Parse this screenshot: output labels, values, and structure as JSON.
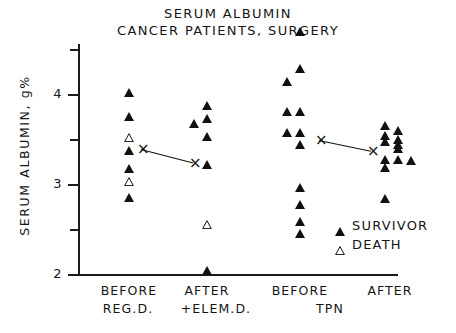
{
  "title": {
    "line1": "SERUM ALBUMIN",
    "line2": "CANCER PATIENTS, SURGERY"
  },
  "axes": {
    "y_title": "SERUM ALBUMIN, g%",
    "y_ticks_major": [
      "4",
      "3",
      "2"
    ],
    "y_ticks_minor": [
      "4.5",
      "3.5",
      "2.5"
    ],
    "ylim": [
      2,
      4.7
    ],
    "x_group_labels": [
      "BEFORE",
      "AFTER",
      "BEFORE",
      "AFTER"
    ],
    "x_treatment_labels": [
      "REG.D.",
      "+ELEM.D.",
      "TPN"
    ]
  },
  "legend": {
    "survivor_label": "SURVIVOR",
    "death_label": "DEATH",
    "survivor_color": "#111111",
    "death_color": "#ffffff"
  },
  "chart_data": {
    "type": "scatter",
    "xlabel": "",
    "ylabel": "SERUM ALBUMIN, g%",
    "ylim": [
      2,
      4.7
    ],
    "grid": false,
    "legend_position": "lower-right",
    "categories": [
      "BEFORE REG.D.",
      "AFTER +ELEM.D.",
      "BEFORE TPN",
      "AFTER TPN"
    ],
    "groups": [
      {
        "name": "BEFORE REG.D.",
        "x_center": 129,
        "mean": 3.4,
        "points": [
          {
            "value": 3.99,
            "status": "survivor",
            "col": 0
          },
          {
            "value": 3.72,
            "status": "survivor",
            "col": 0
          },
          {
            "value": 3.49,
            "status": "death",
            "col": 0
          },
          {
            "value": 3.34,
            "status": "survivor",
            "col": 0
          },
          {
            "value": 3.15,
            "status": "survivor",
            "col": 0
          },
          {
            "value": 3.0,
            "status": "death",
            "col": 0
          },
          {
            "value": 2.82,
            "status": "survivor",
            "col": 0
          }
        ]
      },
      {
        "name": "AFTER +ELEM.D.",
        "x_center": 207,
        "mean": 3.25,
        "points": [
          {
            "value": 3.84,
            "status": "survivor",
            "col": 0
          },
          {
            "value": 3.7,
            "status": "survivor",
            "col": 0
          },
          {
            "value": 3.65,
            "status": "survivor",
            "col": -1
          },
          {
            "value": 3.5,
            "status": "survivor",
            "col": 0
          },
          {
            "value": 3.19,
            "status": "survivor",
            "col": 0
          },
          {
            "value": 2.52,
            "status": "death",
            "col": 0
          },
          {
            "value": 2.01,
            "status": "survivor",
            "col": 0
          }
        ]
      },
      {
        "name": "BEFORE TPN",
        "x_center": 300,
        "mean": 3.5,
        "points": [
          {
            "value": 4.67,
            "status": "survivor",
            "col": 0
          },
          {
            "value": 4.26,
            "status": "survivor",
            "col": 0
          },
          {
            "value": 4.11,
            "status": "survivor",
            "col": -1
          },
          {
            "value": 3.78,
            "status": "survivor",
            "col": 0
          },
          {
            "value": 3.78,
            "status": "survivor",
            "col": -1
          },
          {
            "value": 3.54,
            "status": "survivor",
            "col": 0
          },
          {
            "value": 3.54,
            "status": "survivor",
            "col": -1
          },
          {
            "value": 3.41,
            "status": "survivor",
            "col": 0
          },
          {
            "value": 2.93,
            "status": "survivor",
            "col": 0
          },
          {
            "value": 2.74,
            "status": "survivor",
            "col": 0
          },
          {
            "value": 2.56,
            "status": "survivor",
            "col": 0
          },
          {
            "value": 2.42,
            "status": "survivor",
            "col": 0
          }
        ]
      },
      {
        "name": "AFTER TPN",
        "x_center": 385,
        "mean": 3.38,
        "points": [
          {
            "value": 3.62,
            "status": "survivor",
            "col": 0
          },
          {
            "value": 3.57,
            "status": "survivor",
            "col": 1
          },
          {
            "value": 3.51,
            "status": "survivor",
            "col": 0
          },
          {
            "value": 3.47,
            "status": "survivor",
            "col": 1
          },
          {
            "value": 3.45,
            "status": "survivor",
            "col": 0
          },
          {
            "value": 3.41,
            "status": "survivor",
            "col": 1
          },
          {
            "value": 3.37,
            "status": "survivor",
            "col": 1
          },
          {
            "value": 3.24,
            "status": "survivor",
            "col": 0
          },
          {
            "value": 3.24,
            "status": "survivor",
            "col": 1
          },
          {
            "value": 3.23,
            "status": "survivor",
            "col": 2
          },
          {
            "value": 3.16,
            "status": "survivor",
            "col": 0
          },
          {
            "value": 2.81,
            "status": "survivor",
            "col": 0
          }
        ]
      }
    ],
    "mean_connectors": [
      {
        "from_group": 0,
        "to_group": 1,
        "from_value": 3.4,
        "to_value": 3.25
      },
      {
        "from_group": 2,
        "to_group": 3,
        "from_value": 3.5,
        "to_value": 3.38
      }
    ]
  }
}
